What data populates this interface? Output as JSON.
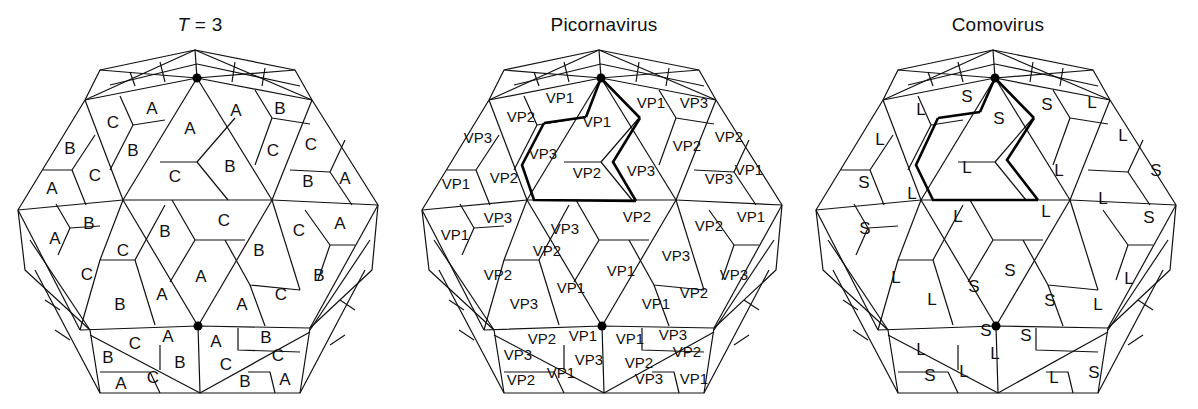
{
  "figure": {
    "panels": [
      {
        "id": "t3",
        "title_prefix": "T",
        "title_suffix": " = 3",
        "offset_x": 0,
        "labels": [
          {
            "t": "A",
            "x": 152,
            "y": 110
          },
          {
            "t": "C",
            "x": 113,
            "y": 124
          },
          {
            "t": "B",
            "x": 70,
            "y": 150
          },
          {
            "t": "B",
            "x": 133,
            "y": 152
          },
          {
            "t": "A",
            "x": 190,
            "y": 130
          },
          {
            "t": "C",
            "x": 95,
            "y": 177
          },
          {
            "t": "A",
            "x": 52,
            "y": 190
          },
          {
            "t": "C",
            "x": 175,
            "y": 178
          },
          {
            "t": "B",
            "x": 230,
            "y": 168
          },
          {
            "t": "A",
            "x": 236,
            "y": 112
          },
          {
            "t": "B",
            "x": 280,
            "y": 110
          },
          {
            "t": "C",
            "x": 273,
            "y": 152
          },
          {
            "t": "C",
            "x": 311,
            "y": 146
          },
          {
            "t": "B",
            "x": 308,
            "y": 183
          },
          {
            "t": "A",
            "x": 345,
            "y": 180
          },
          {
            "t": "B",
            "x": 89,
            "y": 225
          },
          {
            "t": "A",
            "x": 55,
            "y": 240
          },
          {
            "t": "C",
            "x": 123,
            "y": 252
          },
          {
            "t": "C",
            "x": 87,
            "y": 276
          },
          {
            "t": "B",
            "x": 165,
            "y": 233
          },
          {
            "t": "C",
            "x": 224,
            "y": 222
          },
          {
            "t": "B",
            "x": 259,
            "y": 252
          },
          {
            "t": "C",
            "x": 299,
            "y": 232
          },
          {
            "t": "A",
            "x": 340,
            "y": 225
          },
          {
            "t": "A",
            "x": 201,
            "y": 278
          },
          {
            "t": "B",
            "x": 319,
            "y": 277
          },
          {
            "t": "B",
            "x": 120,
            "y": 306
          },
          {
            "t": "A",
            "x": 162,
            "y": 296
          },
          {
            "t": "A",
            "x": 242,
            "y": 306
          },
          {
            "t": "C",
            "x": 281,
            "y": 296
          },
          {
            "t": "A",
            "x": 168,
            "y": 338
          },
          {
            "t": "C",
            "x": 135,
            "y": 345
          },
          {
            "t": "A",
            "x": 216,
            "y": 343
          },
          {
            "t": "B",
            "x": 266,
            "y": 339
          },
          {
            "t": "B",
            "x": 108,
            "y": 359
          },
          {
            "t": "B",
            "x": 180,
            "y": 364
          },
          {
            "t": "C",
            "x": 226,
            "y": 366
          },
          {
            "t": "C",
            "x": 278,
            "y": 357
          },
          {
            "t": "C",
            "x": 153,
            "y": 379
          },
          {
            "t": "A",
            "x": 121,
            "y": 385
          },
          {
            "t": "B",
            "x": 245,
            "y": 383
          },
          {
            "t": "A",
            "x": 285,
            "y": 381
          }
        ]
      },
      {
        "id": "picornavirus",
        "title": "Picornavirus",
        "offset_x": 404,
        "labels": [
          {
            "t": "VP1",
            "x": 156,
            "y": 99
          },
          {
            "t": "VP2",
            "x": 117,
            "y": 118
          },
          {
            "t": "VP3",
            "x": 74,
            "y": 139
          },
          {
            "t": "VP1",
            "x": 193,
            "y": 123
          },
          {
            "t": "VP3",
            "x": 139,
            "y": 155
          },
          {
            "t": "VP1",
            "x": 52,
            "y": 185
          },
          {
            "t": "VP2",
            "x": 100,
            "y": 179
          },
          {
            "t": "VP2",
            "x": 183,
            "y": 174
          },
          {
            "t": "VP1",
            "x": 247,
            "y": 104
          },
          {
            "t": "VP3",
            "x": 290,
            "y": 104
          },
          {
            "t": "VP2",
            "x": 283,
            "y": 147
          },
          {
            "t": "VP2",
            "x": 325,
            "y": 138
          },
          {
            "t": "VP3",
            "x": 237,
            "y": 172
          },
          {
            "t": "VP3",
            "x": 315,
            "y": 180
          },
          {
            "t": "VP1",
            "x": 345,
            "y": 171
          },
          {
            "t": "VP3",
            "x": 94,
            "y": 219
          },
          {
            "t": "VP1",
            "x": 51,
            "y": 236
          },
          {
            "t": "VP2",
            "x": 143,
            "y": 252
          },
          {
            "t": "VP2",
            "x": 94,
            "y": 276
          },
          {
            "t": "VP3",
            "x": 161,
            "y": 230
          },
          {
            "t": "VP2",
            "x": 233,
            "y": 218
          },
          {
            "t": "VP2",
            "x": 305,
            "y": 227
          },
          {
            "t": "VP1",
            "x": 347,
            "y": 218
          },
          {
            "t": "VP1",
            "x": 217,
            "y": 272
          },
          {
            "t": "VP3",
            "x": 272,
            "y": 257
          },
          {
            "t": "VP3",
            "x": 330,
            "y": 276
          },
          {
            "t": "VP1",
            "x": 167,
            "y": 289
          },
          {
            "t": "VP3",
            "x": 120,
            "y": 305
          },
          {
            "t": "VP1",
            "x": 252,
            "y": 305
          },
          {
            "t": "VP2",
            "x": 290,
            "y": 294
          },
          {
            "t": "VP2",
            "x": 138,
            "y": 340
          },
          {
            "t": "VP1",
            "x": 179,
            "y": 337
          },
          {
            "t": "VP1",
            "x": 226,
            "y": 340
          },
          {
            "t": "VP3",
            "x": 269,
            "y": 336
          },
          {
            "t": "VP3",
            "x": 114,
            "y": 356
          },
          {
            "t": "VP3",
            "x": 185,
            "y": 361
          },
          {
            "t": "VP2",
            "x": 235,
            "y": 364
          },
          {
            "t": "VP2",
            "x": 283,
            "y": 353
          },
          {
            "t": "VP2",
            "x": 117,
            "y": 381
          },
          {
            "t": "VP1",
            "x": 157,
            "y": 374
          },
          {
            "t": "VP3",
            "x": 245,
            "y": 380
          },
          {
            "t": "VP1",
            "x": 290,
            "y": 380
          }
        ]
      },
      {
        "id": "comovirus",
        "title": "Comovirus",
        "offset_x": 798,
        "labels": [
          {
            "t": "S",
            "x": 169,
            "y": 98
          },
          {
            "t": "L",
            "x": 123,
            "y": 111
          },
          {
            "t": "S",
            "x": 201,
            "y": 120
          },
          {
            "t": "L",
            "x": 82,
            "y": 141
          },
          {
            "t": "S",
            "x": 66,
            "y": 184
          },
          {
            "t": "L",
            "x": 114,
            "y": 195
          },
          {
            "t": "L",
            "x": 169,
            "y": 169
          },
          {
            "t": "S",
            "x": 249,
            "y": 106
          },
          {
            "t": "L",
            "x": 294,
            "y": 104
          },
          {
            "t": "L",
            "x": 325,
            "y": 137
          },
          {
            "t": "S",
            "x": 358,
            "y": 172
          },
          {
            "t": "L",
            "x": 261,
            "y": 172
          },
          {
            "t": "L",
            "x": 305,
            "y": 200
          },
          {
            "t": "L",
            "x": 160,
            "y": 218
          },
          {
            "t": "L",
            "x": 248,
            "y": 213
          },
          {
            "t": "S",
            "x": 351,
            "y": 219
          },
          {
            "t": "S",
            "x": 67,
            "y": 230
          },
          {
            "t": "L",
            "x": 98,
            "y": 279
          },
          {
            "t": "L",
            "x": 134,
            "y": 301
          },
          {
            "t": "S",
            "x": 176,
            "y": 288
          },
          {
            "t": "S",
            "x": 212,
            "y": 272
          },
          {
            "t": "S",
            "x": 252,
            "y": 302
          },
          {
            "t": "L",
            "x": 300,
            "y": 306
          },
          {
            "t": "L",
            "x": 331,
            "y": 280
          },
          {
            "t": "S",
            "x": 188,
            "y": 332
          },
          {
            "t": "S",
            "x": 228,
            "y": 337
          },
          {
            "t": "L",
            "x": 123,
            "y": 351
          },
          {
            "t": "L",
            "x": 197,
            "y": 355
          },
          {
            "t": "S",
            "x": 132,
            "y": 377
          },
          {
            "t": "L",
            "x": 166,
            "y": 373
          },
          {
            "t": "L",
            "x": 256,
            "y": 379
          },
          {
            "t": "S",
            "x": 296,
            "y": 374
          }
        ]
      }
    ],
    "caption_fragment": "…with the use of simple T = 3 icos…"
  }
}
